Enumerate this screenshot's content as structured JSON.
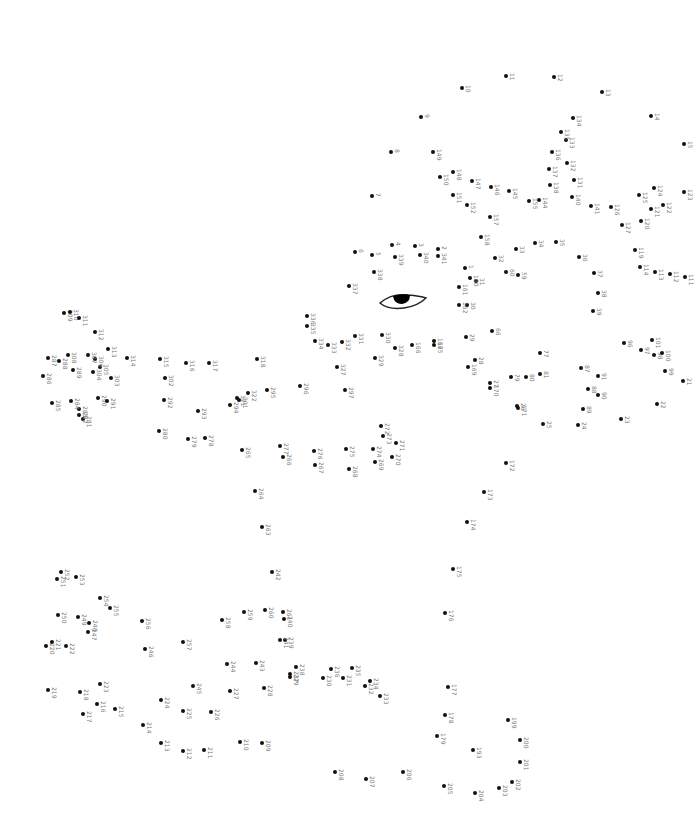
{
  "puzzle": {
    "type": "dot-to-dot",
    "label_color": "#777777",
    "dot_color": "#111111",
    "eye_icon": "eye-icon",
    "dots": [
      {
        "n": "1",
        "x": 465,
        "y": 268
      },
      {
        "n": "2",
        "x": 438,
        "y": 249
      },
      {
        "n": "3",
        "x": 415,
        "y": 246
      },
      {
        "n": "4",
        "x": 392,
        "y": 245
      },
      {
        "n": "5",
        "x": 372,
        "y": 255
      },
      {
        "n": "6",
        "x": 355,
        "y": 252
      },
      {
        "n": "7",
        "x": 372,
        "y": 196
      },
      {
        "n": "8",
        "x": 391,
        "y": 152
      },
      {
        "n": "9",
        "x": 421,
        "y": 117
      },
      {
        "n": "10",
        "x": 462,
        "y": 88
      },
      {
        "n": "11",
        "x": 506,
        "y": 76
      },
      {
        "n": "12",
        "x": 554,
        "y": 77
      },
      {
        "n": "13",
        "x": 602,
        "y": 92
      },
      {
        "n": "14",
        "x": 651,
        "y": 116
      },
      {
        "n": "15",
        "x": 684,
        "y": 144
      },
      {
        "n": "21",
        "x": 683,
        "y": 381
      },
      {
        "n": "22",
        "x": 657,
        "y": 404
      },
      {
        "n": "23",
        "x": 621,
        "y": 419
      },
      {
        "n": "24",
        "x": 578,
        "y": 425
      },
      {
        "n": "25",
        "x": 543,
        "y": 424
      },
      {
        "n": "26",
        "x": 517,
        "y": 406
      },
      {
        "n": "27",
        "x": 490,
        "y": 383
      },
      {
        "n": "28",
        "x": 475,
        "y": 360
      },
      {
        "n": "29",
        "x": 466,
        "y": 337
      },
      {
        "n": "30",
        "x": 467,
        "y": 305
      },
      {
        "n": "31",
        "x": 476,
        "y": 281
      },
      {
        "n": "32",
        "x": 495,
        "y": 258
      },
      {
        "n": "33",
        "x": 516,
        "y": 249
      },
      {
        "n": "34",
        "x": 535,
        "y": 243
      },
      {
        "n": "35",
        "x": 556,
        "y": 242
      },
      {
        "n": "36",
        "x": 579,
        "y": 257
      },
      {
        "n": "37",
        "x": 594,
        "y": 273
      },
      {
        "n": "38",
        "x": 598,
        "y": 293
      },
      {
        "n": "39",
        "x": 593,
        "y": 311
      },
      {
        "n": "59",
        "x": 518,
        "y": 275
      },
      {
        "n": "60",
        "x": 506,
        "y": 272
      },
      {
        "n": "66",
        "x": 492,
        "y": 331
      },
      {
        "n": "77",
        "x": 540,
        "y": 353
      },
      {
        "n": "79",
        "x": 511,
        "y": 377
      },
      {
        "n": "80",
        "x": 526,
        "y": 377
      },
      {
        "n": "81",
        "x": 540,
        "y": 374
      },
      {
        "n": "87",
        "x": 581,
        "y": 368
      },
      {
        "n": "88",
        "x": 588,
        "y": 389
      },
      {
        "n": "89",
        "x": 583,
        "y": 409
      },
      {
        "n": "90",
        "x": 598,
        "y": 395
      },
      {
        "n": "91",
        "x": 598,
        "y": 376
      },
      {
        "n": "96",
        "x": 624,
        "y": 343
      },
      {
        "n": "97",
        "x": 641,
        "y": 350
      },
      {
        "n": "98",
        "x": 654,
        "y": 355
      },
      {
        "n": "99",
        "x": 665,
        "y": 371
      },
      {
        "n": "100",
        "x": 662,
        "y": 353
      },
      {
        "n": "101",
        "x": 652,
        "y": 340
      },
      {
        "n": "111",
        "x": 685,
        "y": 277
      },
      {
        "n": "112",
        "x": 670,
        "y": 274
      },
      {
        "n": "113",
        "x": 655,
        "y": 272
      },
      {
        "n": "114",
        "x": 640,
        "y": 267
      },
      {
        "n": "119",
        "x": 635,
        "y": 250
      },
      {
        "n": "120",
        "x": 641,
        "y": 221
      },
      {
        "n": "121",
        "x": 651,
        "y": 209
      },
      {
        "n": "122",
        "x": 663,
        "y": 205
      },
      {
        "n": "123",
        "x": 684,
        "y": 192
      },
      {
        "n": "124",
        "x": 654,
        "y": 188
      },
      {
        "n": "125",
        "x": 639,
        "y": 195
      },
      {
        "n": "126",
        "x": 611,
        "y": 207
      },
      {
        "n": "127",
        "x": 622,
        "y": 225
      },
      {
        "n": "131",
        "x": 574,
        "y": 180
      },
      {
        "n": "132",
        "x": 567,
        "y": 163
      },
      {
        "n": "133",
        "x": 566,
        "y": 140
      },
      {
        "n": "134",
        "x": 573,
        "y": 118
      },
      {
        "n": "135",
        "x": 561,
        "y": 132
      },
      {
        "n": "136",
        "x": 552,
        "y": 152
      },
      {
        "n": "137",
        "x": 549,
        "y": 169
      },
      {
        "n": "138",
        "x": 550,
        "y": 185
      },
      {
        "n": "140",
        "x": 572,
        "y": 197
      },
      {
        "n": "141",
        "x": 591,
        "y": 206
      },
      {
        "n": "144",
        "x": 539,
        "y": 200
      },
      {
        "n": "145",
        "x": 509,
        "y": 191
      },
      {
        "n": "146",
        "x": 491,
        "y": 187
      },
      {
        "n": "147",
        "x": 472,
        "y": 181
      },
      {
        "n": "148",
        "x": 453,
        "y": 172
      },
      {
        "n": "149",
        "x": 433,
        "y": 152
      },
      {
        "n": "150",
        "x": 440,
        "y": 177
      },
      {
        "n": "151",
        "x": 453,
        "y": 195
      },
      {
        "n": "152",
        "x": 467,
        "y": 205
      },
      {
        "n": "155",
        "x": 529,
        "y": 201
      },
      {
        "n": "157",
        "x": 490,
        "y": 217
      },
      {
        "n": "158",
        "x": 481,
        "y": 237
      },
      {
        "n": "160",
        "x": 470,
        "y": 278
      },
      {
        "n": "161",
        "x": 459,
        "y": 287
      },
      {
        "n": "162",
        "x": 459,
        "y": 305
      },
      {
        "n": "165",
        "x": 434,
        "y": 345
      },
      {
        "n": "166",
        "x": 412,
        "y": 345
      },
      {
        "n": "167",
        "x": 434,
        "y": 341
      },
      {
        "n": "169",
        "x": 468,
        "y": 367
      },
      {
        "n": "170",
        "x": 490,
        "y": 388
      },
      {
        "n": "171",
        "x": 518,
        "y": 408
      },
      {
        "n": "172",
        "x": 506,
        "y": 463
      },
      {
        "n": "173",
        "x": 484,
        "y": 492
      },
      {
        "n": "174",
        "x": 467,
        "y": 522
      },
      {
        "n": "175",
        "x": 453,
        "y": 569
      },
      {
        "n": "176",
        "x": 445,
        "y": 613
      },
      {
        "n": "177",
        "x": 448,
        "y": 687
      },
      {
        "n": "178",
        "x": 445,
        "y": 715
      },
      {
        "n": "179",
        "x": 437,
        "y": 736
      },
      {
        "n": "193",
        "x": 473,
        "y": 750
      },
      {
        "n": "199",
        "x": 508,
        "y": 720
      },
      {
        "n": "200",
        "x": 520,
        "y": 740
      },
      {
        "n": "201",
        "x": 520,
        "y": 762
      },
      {
        "n": "202",
        "x": 512,
        "y": 782
      },
      {
        "n": "203",
        "x": 499,
        "y": 788
      },
      {
        "n": "204",
        "x": 475,
        "y": 793
      },
      {
        "n": "205",
        "x": 444,
        "y": 786
      },
      {
        "n": "206",
        "x": 403,
        "y": 772
      },
      {
        "n": "207",
        "x": 366,
        "y": 779
      },
      {
        "n": "208",
        "x": 335,
        "y": 772
      },
      {
        "n": "209",
        "x": 262,
        "y": 743
      },
      {
        "n": "210",
        "x": 240,
        "y": 742
      },
      {
        "n": "211",
        "x": 204,
        "y": 750
      },
      {
        "n": "212",
        "x": 183,
        "y": 751
      },
      {
        "n": "213",
        "x": 161,
        "y": 743
      },
      {
        "n": "214",
        "x": 143,
        "y": 725
      },
      {
        "n": "215",
        "x": 115,
        "y": 709
      },
      {
        "n": "216",
        "x": 97,
        "y": 704
      },
      {
        "n": "217",
        "x": 83,
        "y": 714
      },
      {
        "n": "218",
        "x": 80,
        "y": 692
      },
      {
        "n": "219",
        "x": 48,
        "y": 690
      },
      {
        "n": "220",
        "x": 46,
        "y": 646
      },
      {
        "n": "221",
        "x": 52,
        "y": 642
      },
      {
        "n": "222",
        "x": 66,
        "y": 646
      },
      {
        "n": "223",
        "x": 100,
        "y": 684
      },
      {
        "n": "224",
        "x": 161,
        "y": 700
      },
      {
        "n": "225",
        "x": 183,
        "y": 711
      },
      {
        "n": "226",
        "x": 211,
        "y": 712
      },
      {
        "n": "227",
        "x": 230,
        "y": 691
      },
      {
        "n": "228",
        "x": 264,
        "y": 688
      },
      {
        "n": "229",
        "x": 290,
        "y": 677
      },
      {
        "n": "230",
        "x": 323,
        "y": 678
      },
      {
        "n": "231",
        "x": 343,
        "y": 678
      },
      {
        "n": "232",
        "x": 365,
        "y": 686
      },
      {
        "n": "233",
        "x": 380,
        "y": 696
      },
      {
        "n": "234",
        "x": 370,
        "y": 681
      },
      {
        "n": "235",
        "x": 352,
        "y": 668
      },
      {
        "n": "236",
        "x": 331,
        "y": 669
      },
      {
        "n": "237",
        "x": 290,
        "y": 674
      },
      {
        "n": "238",
        "x": 296,
        "y": 667
      },
      {
        "n": "239",
        "x": 285,
        "y": 640
      },
      {
        "n": "240",
        "x": 284,
        "y": 619
      },
      {
        "n": "241",
        "x": 280,
        "y": 640
      },
      {
        "n": "242",
        "x": 272,
        "y": 572
      },
      {
        "n": "243",
        "x": 256,
        "y": 663
      },
      {
        "n": "244",
        "x": 227,
        "y": 664
      },
      {
        "n": "245",
        "x": 193,
        "y": 686
      },
      {
        "n": "246",
        "x": 145,
        "y": 649
      },
      {
        "n": "247",
        "x": 88,
        "y": 632
      },
      {
        "n": "248",
        "x": 89,
        "y": 623
      },
      {
        "n": "249",
        "x": 78,
        "y": 617
      },
      {
        "n": "250",
        "x": 58,
        "y": 615
      },
      {
        "n": "251",
        "x": 57,
        "y": 579
      },
      {
        "n": "252",
        "x": 61,
        "y": 572
      },
      {
        "n": "253",
        "x": 76,
        "y": 577
      },
      {
        "n": "254",
        "x": 100,
        "y": 598
      },
      {
        "n": "255",
        "x": 110,
        "y": 608
      },
      {
        "n": "256",
        "x": 142,
        "y": 621
      },
      {
        "n": "257",
        "x": 183,
        "y": 642
      },
      {
        "n": "258",
        "x": 222,
        "y": 620
      },
      {
        "n": "259",
        "x": 244,
        "y": 612
      },
      {
        "n": "260",
        "x": 265,
        "y": 610
      },
      {
        "n": "261",
        "x": 283,
        "y": 612
      },
      {
        "n": "263",
        "x": 262,
        "y": 527
      },
      {
        "n": "264",
        "x": 255,
        "y": 491
      },
      {
        "n": "265",
        "x": 242,
        "y": 450
      },
      {
        "n": "266",
        "x": 283,
        "y": 457
      },
      {
        "n": "267",
        "x": 315,
        "y": 465
      },
      {
        "n": "268",
        "x": 349,
        "y": 469
      },
      {
        "n": "269",
        "x": 375,
        "y": 462
      },
      {
        "n": "270",
        "x": 392,
        "y": 457
      },
      {
        "n": "271",
        "x": 396,
        "y": 443
      },
      {
        "n": "272",
        "x": 381,
        "y": 426
      },
      {
        "n": "273",
        "x": 383,
        "y": 436
      },
      {
        "n": "274",
        "x": 373,
        "y": 449
      },
      {
        "n": "275",
        "x": 346,
        "y": 449
      },
      {
        "n": "276",
        "x": 314,
        "y": 451
      },
      {
        "n": "277",
        "x": 280,
        "y": 446
      },
      {
        "n": "278",
        "x": 205,
        "y": 438
      },
      {
        "n": "279",
        "x": 188,
        "y": 439
      },
      {
        "n": "280",
        "x": 159,
        "y": 431
      },
      {
        "n": "281",
        "x": 83,
        "y": 419
      },
      {
        "n": "282",
        "x": 79,
        "y": 415
      },
      {
        "n": "283",
        "x": 79,
        "y": 409
      },
      {
        "n": "284",
        "x": 71,
        "y": 401
      },
      {
        "n": "285",
        "x": 52,
        "y": 403
      },
      {
        "n": "286",
        "x": 43,
        "y": 376
      },
      {
        "n": "287",
        "x": 48,
        "y": 358
      },
      {
        "n": "288",
        "x": 59,
        "y": 361
      },
      {
        "n": "289",
        "x": 73,
        "y": 370
      },
      {
        "n": "290",
        "x": 98,
        "y": 398
      },
      {
        "n": "291",
        "x": 107,
        "y": 401
      },
      {
        "n": "292",
        "x": 164,
        "y": 400
      },
      {
        "n": "293",
        "x": 198,
        "y": 411
      },
      {
        "n": "294",
        "x": 230,
        "y": 405
      },
      {
        "n": "295",
        "x": 267,
        "y": 390
      },
      {
        "n": "296",
        "x": 300,
        "y": 386
      },
      {
        "n": "297",
        "x": 345,
        "y": 390
      },
      {
        "n": "301",
        "x": 239,
        "y": 400
      },
      {
        "n": "302",
        "x": 165,
        "y": 378
      },
      {
        "n": "303",
        "x": 111,
        "y": 378
      },
      {
        "n": "304",
        "x": 93,
        "y": 372
      },
      {
        "n": "305",
        "x": 100,
        "y": 367
      },
      {
        "n": "306",
        "x": 95,
        "y": 359
      },
      {
        "n": "307",
        "x": 88,
        "y": 355
      },
      {
        "n": "308",
        "x": 68,
        "y": 355
      },
      {
        "n": "309",
        "x": 64,
        "y": 313
      },
      {
        "n": "310",
        "x": 70,
        "y": 312
      },
      {
        "n": "311",
        "x": 79,
        "y": 318
      },
      {
        "n": "312",
        "x": 95,
        "y": 332
      },
      {
        "n": "313",
        "x": 108,
        "y": 349
      },
      {
        "n": "314",
        "x": 127,
        "y": 358
      },
      {
        "n": "315",
        "x": 160,
        "y": 359
      },
      {
        "n": "316",
        "x": 186,
        "y": 363
      },
      {
        "n": "317",
        "x": 209,
        "y": 363
      },
      {
        "n": "318",
        "x": 257,
        "y": 359
      },
      {
        "n": "321",
        "x": 237,
        "y": 398
      },
      {
        "n": "322",
        "x": 248,
        "y": 393
      },
      {
        "n": "327",
        "x": 337,
        "y": 367
      },
      {
        "n": "328",
        "x": 395,
        "y": 348
      },
      {
        "n": "329",
        "x": 375,
        "y": 358
      },
      {
        "n": "330",
        "x": 382,
        "y": 335
      },
      {
        "n": "331",
        "x": 355,
        "y": 336
      },
      {
        "n": "332",
        "x": 342,
        "y": 342
      },
      {
        "n": "333",
        "x": 328,
        "y": 345
      },
      {
        "n": "334",
        "x": 315,
        "y": 341
      },
      {
        "n": "335",
        "x": 307,
        "y": 326
      },
      {
        "n": "336",
        "x": 307,
        "y": 316
      },
      {
        "n": "337",
        "x": 349,
        "y": 286
      },
      {
        "n": "338",
        "x": 374,
        "y": 272
      },
      {
        "n": "339",
        "x": 395,
        "y": 257
      },
      {
        "n": "340",
        "x": 420,
        "y": 255
      },
      {
        "n": "341",
        "x": 438,
        "y": 256
      }
    ]
  }
}
